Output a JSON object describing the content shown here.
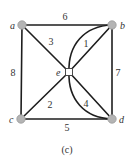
{
  "figure": {
    "caption": "(c)",
    "colors": {
      "edge": "#1e1e1e",
      "node_fill": "#b4b4b4",
      "center_node_fill": "#ffffff",
      "text": "#333333"
    }
  },
  "nodes": [
    {
      "id": "a",
      "label": "a",
      "shape": "circle"
    },
    {
      "id": "b",
      "label": "b",
      "shape": "circle"
    },
    {
      "id": "c",
      "label": "c",
      "shape": "circle"
    },
    {
      "id": "d",
      "label": "d",
      "shape": "circle"
    },
    {
      "id": "e",
      "label": "e",
      "shape": "square"
    }
  ],
  "edges": [
    {
      "from": "a",
      "to": "b",
      "weight": "6",
      "style": "straight"
    },
    {
      "from": "b",
      "to": "d",
      "weight": "7",
      "style": "straight"
    },
    {
      "from": "a",
      "to": "c",
      "weight": "8",
      "style": "straight"
    },
    {
      "from": "c",
      "to": "d",
      "weight": "5",
      "style": "straight"
    },
    {
      "from": "a",
      "to": "e",
      "weight": "3",
      "style": "straight"
    },
    {
      "from": "e",
      "to": "b",
      "weight": "1",
      "style": "straight-and-curved"
    },
    {
      "from": "c",
      "to": "e",
      "weight": "2",
      "style": "straight"
    },
    {
      "from": "e",
      "to": "d",
      "weight": "4",
      "style": "straight-and-curved"
    }
  ]
}
